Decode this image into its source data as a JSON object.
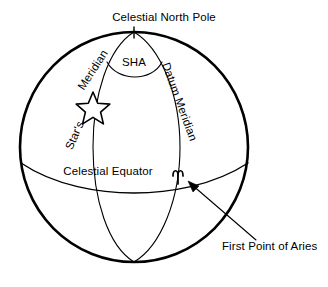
{
  "figure": {
    "type": "celestial-sphere-diagram",
    "background_color": "#ffffff",
    "line_color": "#000000",
    "width": 328,
    "height": 287
  },
  "labels": {
    "celestial_north_pole": "Celestial North Pole",
    "sha": "SHA",
    "stars": "Star's",
    "meridian": "Meridian",
    "datum_meridian": "Datum Meridian",
    "celestial_equator": "Celestial Equator",
    "first_point_of_aries": "First Point of Aries"
  },
  "icons": {
    "star": "star-icon",
    "aries": "aries-symbol-icon",
    "pointer_arrow": "arrow-pointer-icon"
  },
  "geometry": {
    "sphere_center_x": 134,
    "sphere_center_y": 147,
    "sphere_radius_x": 114,
    "sphere_radius_y": 115,
    "north_pole_x": 134,
    "north_pole_y": 32,
    "south_pole_x": 134,
    "south_pole_y": 262,
    "equator_left_x": 21,
    "equator_right_x": 248,
    "equator_edge_y": 163,
    "equator_center_y": 182,
    "stars_meridian_equator_x": 93,
    "datum_meridian_equator_x": 180,
    "star_center_x": 93,
    "star_center_y": 105,
    "aries_x": 181,
    "aries_y": 175,
    "arrow_tail_x": 256,
    "arrow_tail_y": 240,
    "arrow_head_x": 189,
    "arrow_head_y": 183
  }
}
